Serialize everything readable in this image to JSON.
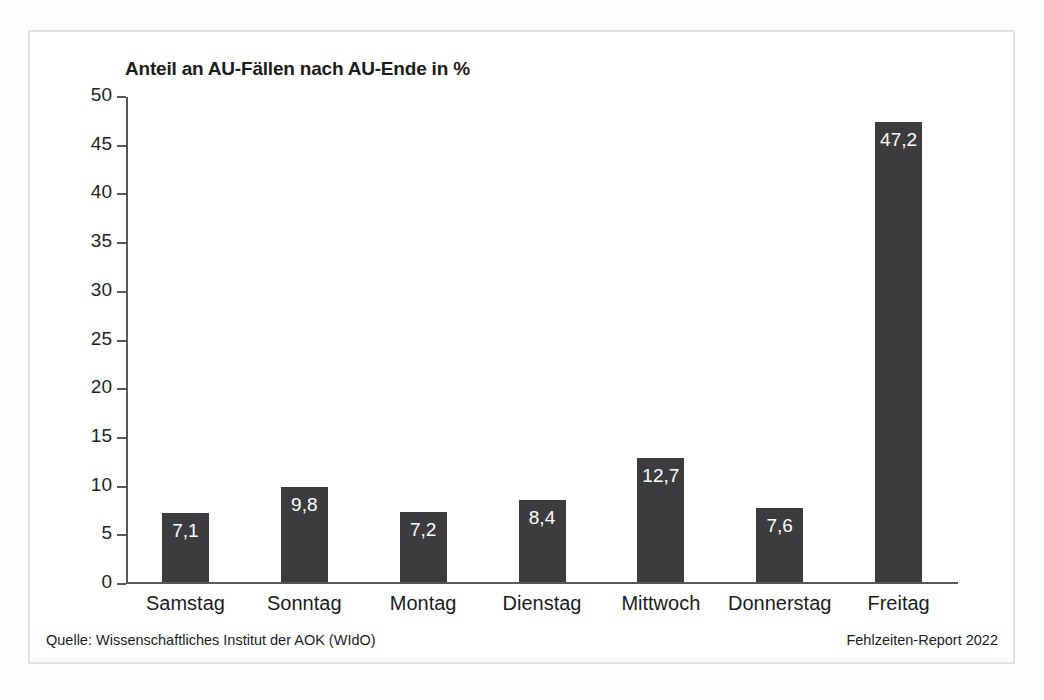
{
  "chart_data": {
    "type": "bar",
    "title": "Anteil an AU-Fällen nach AU-Ende in %",
    "xlabel": "",
    "ylabel": "",
    "ylim": [
      0,
      50
    ],
    "yticks": [
      "0",
      "5",
      "10",
      "15",
      "20",
      "25",
      "30",
      "35",
      "40",
      "45",
      "50"
    ],
    "grid": false,
    "legend": null,
    "bar_color": "#3c3c3e",
    "categories": [
      "Samstag",
      "Sonntag",
      "Montag",
      "Dienstag",
      "Mittwoch",
      "Donnerstag",
      "Freitag"
    ],
    "values": [
      7.1,
      9.8,
      7.2,
      8.4,
      12.7,
      7.6,
      47.2
    ],
    "value_labels": [
      "7,1",
      "9,8",
      "7,2",
      "8,4",
      "12,7",
      "7,6",
      "47,2"
    ]
  },
  "footer": {
    "source": "Quelle: Wissenschaftliches Institut der AOK (WIdO)",
    "report": "Fehlzeiten-Report 2022"
  }
}
